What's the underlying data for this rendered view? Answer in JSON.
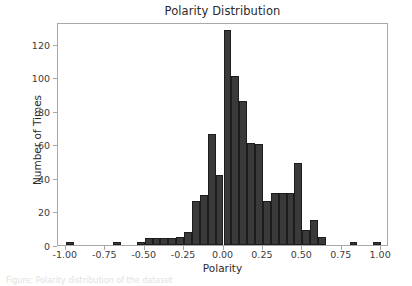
{
  "chart_data": {
    "type": "bar",
    "title": "Polarity Distribution",
    "xlabel": "Polarity",
    "ylabel": "Number of Times",
    "xlim": [
      -1.05,
      1.05
    ],
    "ylim": [
      0,
      133
    ],
    "grid": false,
    "legend": null,
    "bar_width": 0.05,
    "bar_color": "#3a3a3a",
    "edge_color": "#1d1d1d",
    "xticks": [
      -1.0,
      -0.75,
      -0.5,
      -0.25,
      0.0,
      0.25,
      0.5,
      0.75,
      1.0
    ],
    "xtick_labels": [
      "-1.00",
      "-0.75",
      "-0.50",
      "-0.25",
      "0.00",
      "0.25",
      "0.50",
      "0.75",
      "1.00"
    ],
    "yticks": [
      0,
      20,
      40,
      60,
      80,
      100,
      120
    ],
    "ytick_labels": [
      "0",
      "20",
      "40",
      "60",
      "80",
      "100",
      "120"
    ],
    "bins": [
      {
        "x": -1.0,
        "value": 2
      },
      {
        "x": -0.7,
        "value": 2
      },
      {
        "x": -0.55,
        "value": 2
      },
      {
        "x": -0.5,
        "value": 4
      },
      {
        "x": -0.45,
        "value": 4
      },
      {
        "x": -0.4,
        "value": 4
      },
      {
        "x": -0.35,
        "value": 4
      },
      {
        "x": -0.3,
        "value": 5
      },
      {
        "x": -0.25,
        "value": 8
      },
      {
        "x": -0.2,
        "value": 26
      },
      {
        "x": -0.15,
        "value": 30
      },
      {
        "x": -0.1,
        "value": 66
      },
      {
        "x": -0.05,
        "value": 42
      },
      {
        "x": 0.0,
        "value": 128
      },
      {
        "x": 0.05,
        "value": 101
      },
      {
        "x": 0.1,
        "value": 86
      },
      {
        "x": 0.15,
        "value": 61
      },
      {
        "x": 0.2,
        "value": 60
      },
      {
        "x": 0.25,
        "value": 26
      },
      {
        "x": 0.3,
        "value": 31
      },
      {
        "x": 0.35,
        "value": 31
      },
      {
        "x": 0.4,
        "value": 31
      },
      {
        "x": 0.45,
        "value": 49
      },
      {
        "x": 0.5,
        "value": 9
      },
      {
        "x": 0.55,
        "value": 15
      },
      {
        "x": 0.6,
        "value": 5
      },
      {
        "x": 0.8,
        "value": 2
      },
      {
        "x": 0.95,
        "value": 2
      }
    ]
  },
  "caption": {
    "text": "Figure: Polarity distribution of the dataset"
  }
}
